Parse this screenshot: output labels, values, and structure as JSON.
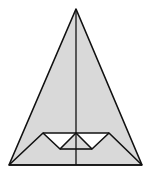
{
  "diagram": {
    "fill_color": "#d9d9d9",
    "stroke_color": "#111111",
    "background": "#ffffff",
    "outer_triangle": {
      "apex": [
        76,
        9
      ],
      "left": [
        9,
        165
      ],
      "right": [
        142,
        165
      ]
    },
    "center_line": {
      "from": [
        76,
        9
      ],
      "to": [
        76,
        165
      ]
    },
    "inner_shape": {
      "top_left": [
        43,
        133
      ],
      "top_mid": [
        76,
        133
      ],
      "top_right": [
        109,
        133
      ],
      "bottom_left": [
        60,
        149
      ],
      "bottom_right": [
        92,
        149
      ]
    }
  }
}
